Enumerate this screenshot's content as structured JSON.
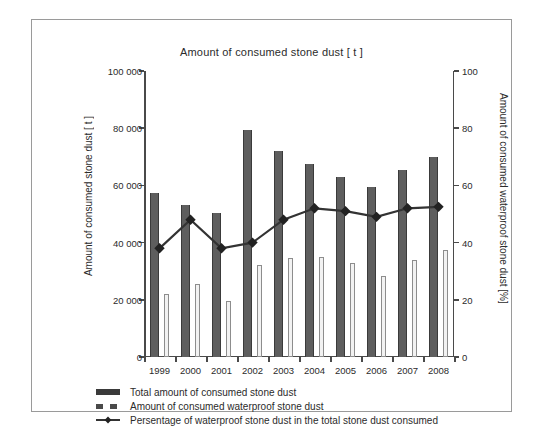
{
  "chart_data": {
    "type": "bar",
    "title": "Amount of consumed stone dust [ t ]",
    "categories": [
      "1999",
      "2000",
      "2001",
      "2002",
      "2003",
      "2004",
      "2005",
      "2006",
      "2007",
      "2008"
    ],
    "xlabel": "",
    "ylabel": "Amount of consumed stone dust [ t ]",
    "y2label": "Amount of consumed waterproof stone dust [%]",
    "ylim": [
      0,
      100000
    ],
    "y2lim": [
      0,
      100
    ],
    "yticks": [
      "0",
      "20 000",
      "40 000",
      "60 000",
      "80 000",
      "100 000"
    ],
    "ytick_values": [
      0,
      20000,
      40000,
      60000,
      80000,
      100000
    ],
    "y2ticks": [
      "0",
      "20",
      "40",
      "60",
      "80",
      "100"
    ],
    "y2tick_values": [
      0,
      20,
      40,
      60,
      80,
      100
    ],
    "grid": false,
    "legend_position": "bottom",
    "series": [
      {
        "name": "Total amount of consumed stone dust",
        "kind": "bar",
        "axis": "left",
        "color": "#5e5e5e",
        "values": [
          57500,
          53000,
          50500,
          79500,
          72000,
          67500,
          63000,
          59500,
          65500,
          70000
        ]
      },
      {
        "name": "Amount of consumed waterproof stone dust",
        "kind": "bar",
        "axis": "left",
        "color": "#f2f2f2",
        "values": [
          22000,
          25500,
          19500,
          32000,
          34500,
          35000,
          33000,
          28500,
          34000,
          37500
        ]
      },
      {
        "name": "Persentage of waterproof stone dust in the total stone dust consumed",
        "kind": "line",
        "axis": "right",
        "color": "#333333",
        "values": [
          38,
          48,
          38,
          40,
          48,
          52,
          51,
          49,
          52,
          52.5
        ]
      }
    ]
  },
  "legend": {
    "items": [
      {
        "label": "Total amount of consumed stone dust",
        "marker": "solid-bar-marker"
      },
      {
        "label": "Amount of consumed waterproof stone dust",
        "marker": "dashed-bar-marker"
      },
      {
        "label": "Persentage of waterproof stone dust in the total stone dust consumed",
        "marker": "line-diamond-marker"
      }
    ]
  }
}
